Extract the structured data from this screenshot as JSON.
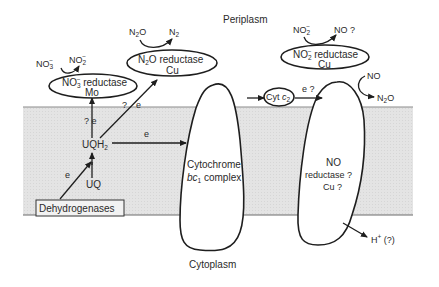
{
  "compartments": {
    "periplasm": "Periplasm",
    "cytoplasm": "Cytoplasm"
  },
  "colors": {
    "membrane_fill": "#e4e4e4",
    "membrane_edge": "#8a8a8a",
    "stroke": "#1e1e1e",
    "text": "#2a2a2a"
  },
  "membrane_components": {
    "dehydrogenases": "Dehydrogenases",
    "uq": "UQ",
    "uqh2_base": "UQH",
    "uqh2_sub": "2",
    "cytochrome_line1": "Cytochrome",
    "cytochrome_line2_italic": "bc",
    "cytochrome_line2_sub": "1",
    "cytochrome_line2_rest": " complex",
    "no_reductase_line1": "NO",
    "no_reductase_line2": "reductase ?",
    "no_reductase_line3": "Cu ?"
  },
  "periplasmic_enzymes": {
    "nitrate_reductase": {
      "line1_base": "NO",
      "line1_sub": "3",
      "line1_sup": "−",
      "line1_rest": " reductase",
      "line2": "Mo"
    },
    "n2o_reductase": {
      "line1_base": "N",
      "line1_sub": "2",
      "line1_rest": "O reductase",
      "line2": "Cu"
    },
    "nitrite_reductase": {
      "line1_base": "NO",
      "line1_sub": "2",
      "line1_sup": "−",
      "line1_rest": " reductase",
      "line2": "Cu"
    },
    "cyt_c2": {
      "base": "Cyt ",
      "italic": "c",
      "sub": "2"
    }
  },
  "reactions": {
    "nitrate": {
      "substrate_base": "NO",
      "substrate_sub": "3",
      "substrate_sup": "−",
      "product_base": "NO",
      "product_sub": "2",
      "product_sup": "−"
    },
    "n2o": {
      "substrate_base": "N",
      "substrate_sub": "2",
      "substrate_rest": "O",
      "product_base": "N",
      "product_sub": "2"
    },
    "nitrite": {
      "substrate_base": "NO",
      "substrate_sub": "2",
      "substrate_sup": "−",
      "product": "NO ?"
    },
    "no": {
      "substrate": "NO",
      "product_base": "N",
      "product_sub": "2",
      "product_rest": "O"
    },
    "proton": {
      "base": "H",
      "sup": "+",
      "rest": " (?)"
    }
  },
  "electron_labels": {
    "dehydrogenase_to_uq": "e",
    "uqh2_to_nitrate": "? e",
    "uqh2_to_n2o_q": "?",
    "uqh2_to_n2o_e": "e",
    "uqh2_to_bc1": "e",
    "c2_to_no": "e ?"
  }
}
